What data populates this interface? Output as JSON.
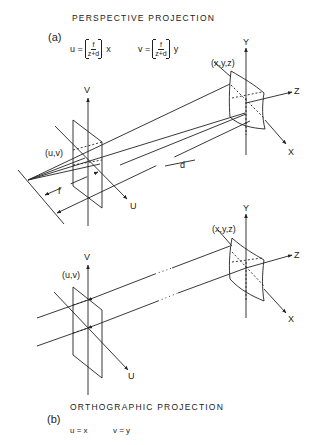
{
  "figure": {
    "panel_a": {
      "letter": "(a)",
      "title": "PERSPECTIVE  PROJECTION",
      "equation_u": {
        "lhs": "u =",
        "num": "f",
        "den": "z+d",
        "var": "x"
      },
      "equation_v": {
        "lhs": "v =",
        "num": "f",
        "den": "z+d",
        "var": "y"
      },
      "labels": {
        "image_axis_v": "V",
        "image_axis_u": "U",
        "image_point": "(u,v)",
        "object_point": "(x,y,z)",
        "world_axis_y": "Y",
        "world_axis_z": "Z",
        "world_axis_x": "X",
        "focal_length": "f",
        "distance": "d"
      }
    },
    "panel_b": {
      "letter": "(b)",
      "title": "ORTHOGRAPHIC  PROJECTION",
      "equation_u": "u = x",
      "equation_v": "v = y",
      "labels": {
        "image_axis_v": "V",
        "image_axis_u": "U",
        "image_point": "(u,v)",
        "object_point": "(x,y,z)",
        "world_axis_y": "Y",
        "world_axis_z": "Z",
        "world_axis_x": "X"
      }
    },
    "colors": {
      "ink": "#222222",
      "background": "#ffffff"
    }
  }
}
